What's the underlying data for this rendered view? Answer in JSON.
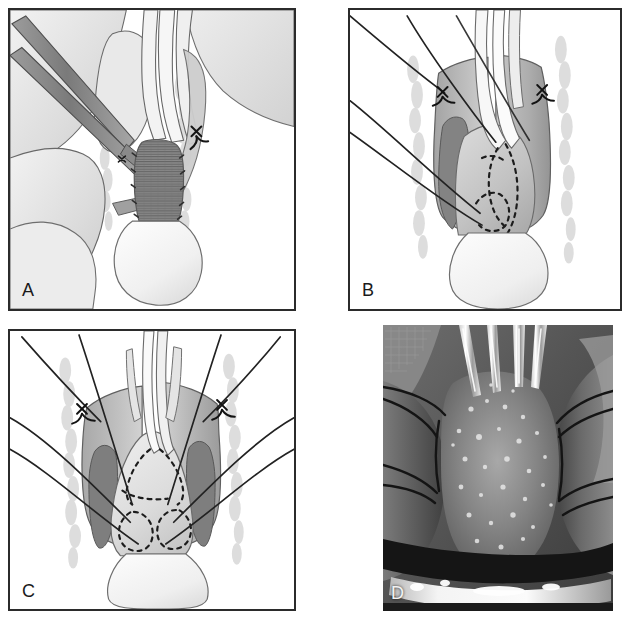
{
  "figure": {
    "kind": "medical-illustration-plate",
    "panel_count": 4,
    "background_color": "#ffffff",
    "border_color": "#2b2b2b",
    "canvas": {
      "width": 631,
      "height": 629
    }
  },
  "panels": [
    {
      "id": "a",
      "label": "A",
      "type": "line-drawing",
      "position": {
        "x": 8,
        "y": 8,
        "width": 288,
        "height": 303
      },
      "label_position": {
        "x": 22,
        "y": 281
      },
      "label_color": "#1a1a1a",
      "description": "Oblique operative view: a pair of long forceps enters from the upper left and grasps tissue; a central tubular structure with dense cross-hatched (corrugated) shading is held between two pale vertical retractors; a suture knot is tied at the upper right margin.",
      "elements": [
        "forceps-instrument",
        "retractor-left",
        "retractor-right",
        "hatched-tubular-structure",
        "suture-knot-upper-right",
        "surrounding-soft-tissue",
        "stippled-tissue-border"
      ],
      "palette": {
        "outline": "#4a4a4a",
        "instrument_fill": "#8c8c8c",
        "instrument_dark": "#6e6e6e",
        "tissue_light": "#e6e6e6",
        "tissue_mid": "#cfcfcf",
        "hatch_dark": "#7d7d7d",
        "stipple": "#dedede"
      }
    },
    {
      "id": "b",
      "label": "B",
      "type": "line-drawing",
      "position": {
        "x": 348,
        "y": 8,
        "width": 274,
        "height": 303
      },
      "label_position": {
        "x": 362,
        "y": 281
      },
      "label_color": "#1a1a1a",
      "description": "Anterior view with four traction sutures running off to the upper-left corner; two stay-suture knots anchor the upper lateral corners of the opened cuff; dotted lines mark the planned incision outline over the shaded posterior wall.",
      "elements": [
        "traction-suture-1",
        "traction-suture-2",
        "traction-suture-3",
        "traction-suture-4",
        "stay-knot-left",
        "stay-knot-right",
        "dashed-incision-outline",
        "central-tube-pair",
        "shaded-cuff-wall",
        "distal-bulb",
        "stipple-border"
      ],
      "palette": {
        "outline": "#4a4a4a",
        "suture": "#2b2b2b",
        "tissue_light": "#e3e3e3",
        "tissue_mid": "#b9b9b9",
        "tissue_dark": "#8f8f8f",
        "dash": "#1f1f1f",
        "stipple": "#dedede"
      }
    },
    {
      "id": "c",
      "label": "C",
      "type": "line-drawing",
      "position": {
        "x": 8,
        "y": 329,
        "width": 288,
        "height": 282
      },
      "label_position": {
        "x": 22,
        "y": 582
      },
      "label_color": "#1a1a1a",
      "description": "Symmetric anterior view after reconstruction: six sutures fan out bilaterally to both upper corners and the lateral margins; two stay knots remain at the upper corners; four dashed arcs outline the repaired anastomotic quadrants over the pale central tissue flap.",
      "elements": [
        "suture-fan-left-upper",
        "suture-fan-left-middle",
        "suture-fan-left-lower",
        "suture-fan-right-upper",
        "suture-fan-right-middle",
        "suture-fan-right-lower",
        "stay-knot-left",
        "stay-knot-right",
        "dashed-arc-upper-left",
        "dashed-arc-upper-right",
        "dashed-arc-lower-left",
        "dashed-arc-lower-right",
        "central-tube",
        "shaded-cuff-wall",
        "distal-bulb",
        "stipple-border"
      ],
      "palette": {
        "outline": "#4a4a4a",
        "suture": "#2b2b2b",
        "tissue_light": "#e8e8e8",
        "tissue_mid": "#b5b5b5",
        "tissue_dark": "#8a8a8a",
        "dash": "#1f1f1f",
        "stipple": "#dedede"
      }
    },
    {
      "id": "d",
      "label": "D",
      "type": "intraoperative-photograph",
      "position": {
        "x": 383,
        "y": 325,
        "width": 230,
        "height": 286
      },
      "label_position": {
        "x": 391,
        "y": 584
      },
      "label_color": "#f2f2f2",
      "description": "Grayscale intraoperative photograph corresponding to the illustrations: three bright metallic instrument tips descend from the top onto glistening granular tissue in the centre; dark monofilament sutures cross the field from the left and right; a bright specular highlight band runs across the lower third.",
      "elements": [
        "instrument-tip-left",
        "instrument-tip-middle",
        "instrument-tip-right",
        "granular-central-tissue",
        "suture-thread-left-upper",
        "suture-thread-left-lower",
        "suture-thread-right-upper",
        "suture-thread-right-lower",
        "dark-tissue-band",
        "specular-highlight-band"
      ],
      "palette": {
        "darkest": "#1a1a1a",
        "dark": "#3c3c3c",
        "mid": "#6a6a6a",
        "light": "#9e9e9e",
        "highlight": "#f0f0f0"
      }
    }
  ]
}
